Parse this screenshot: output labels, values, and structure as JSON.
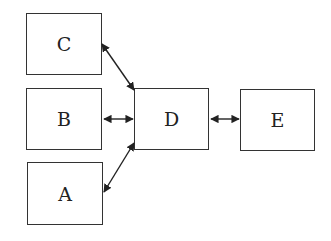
{
  "diagram": {
    "nodes": [
      {
        "id": "C",
        "label": "C",
        "x": 26,
        "y": 13,
        "w": 76,
        "h": 62
      },
      {
        "id": "B",
        "label": "B",
        "x": 26,
        "y": 88,
        "w": 76,
        "h": 62
      },
      {
        "id": "A",
        "label": "A",
        "x": 27,
        "y": 162,
        "w": 76,
        "h": 63
      },
      {
        "id": "D",
        "label": "D",
        "x": 134,
        "y": 88,
        "w": 75,
        "h": 62
      },
      {
        "id": "E",
        "label": "E",
        "x": 240,
        "y": 89,
        "w": 75,
        "h": 62
      }
    ],
    "edges": [
      {
        "from": "C",
        "to": "D",
        "type": "bidirectional"
      },
      {
        "from": "B",
        "to": "D",
        "type": "bidirectional"
      },
      {
        "from": "A",
        "to": "D",
        "type": "bidirectional"
      },
      {
        "from": "D",
        "to": "E",
        "type": "bidirectional"
      }
    ]
  }
}
